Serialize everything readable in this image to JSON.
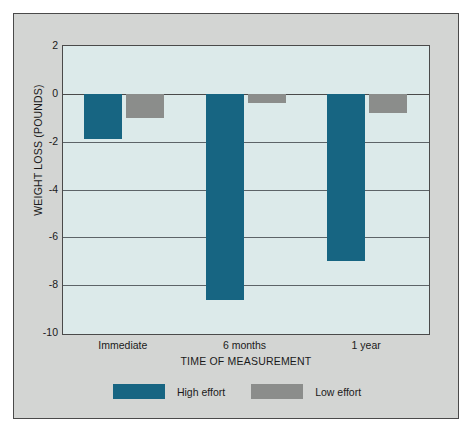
{
  "chart_data": {
    "type": "bar",
    "title": "",
    "xlabel": "TIME OF MEASUREMENT",
    "ylabel": "WEIGHT LOSS (POUNDS)",
    "categories": [
      "Immediate",
      "6 months",
      "1 year"
    ],
    "series": [
      {
        "name": "High effort",
        "color": "#176582",
        "values": [
          -1.9,
          -8.6,
          -7.0
        ]
      },
      {
        "name": "Low effort",
        "color": "#8b8d8b",
        "values": [
          -1.0,
          -0.4,
          -0.8
        ]
      }
    ],
    "ylim": [
      -10,
      2
    ],
    "yticks": [
      2,
      0,
      -2,
      -4,
      -6,
      -8,
      -10
    ],
    "ytick_labels": [
      "2",
      "0",
      "-2",
      "-4",
      "-6",
      "-8",
      "-10"
    ],
    "grid": true,
    "legend_position": "bottom",
    "plot_background": "#dceaea",
    "figure_background": "#d3d5d3",
    "axis_color": "#4a4a4a"
  },
  "legend": {
    "items": [
      {
        "label": "High effort"
      },
      {
        "label": "Low effort"
      }
    ]
  }
}
